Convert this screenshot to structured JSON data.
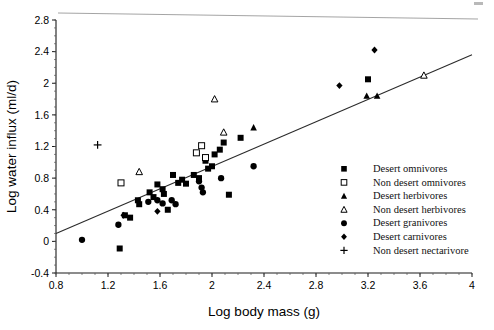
{
  "chart_data": {
    "type": "scatter",
    "title": "",
    "xlabel": "Log body mass (g)",
    "ylabel": "Log water influx (ml/d)",
    "xlim": [
      0.8,
      4.0
    ],
    "ylim": [
      -0.4,
      2.8
    ],
    "xticks": [
      "0.8",
      "1.2",
      "1.6",
      "2",
      "2.4",
      "2.8",
      "3.2",
      "3.6",
      "4"
    ],
    "yticks": [
      "-0.4",
      "0",
      "0.4",
      "0.8",
      "1.2",
      "1.6",
      "2",
      "2.4",
      "2.8"
    ],
    "xtick_values": [
      0.8,
      1.2,
      1.6,
      2.0,
      2.4,
      2.8,
      3.2,
      3.6,
      4.0
    ],
    "ytick_values": [
      -0.4,
      0,
      0.4,
      0.8,
      1.2,
      1.6,
      2.0,
      2.4,
      2.8
    ],
    "grid": false,
    "legend_position": "right-middle",
    "trendline": {
      "label": "regression line",
      "x0": 0.8,
      "y0": 0.1,
      "x1": 4.0,
      "y1": 2.36
    },
    "series": [
      {
        "name": "Desert omnivores",
        "marker": "filled-square",
        "points": [
          [
            1.29,
            -0.09
          ],
          [
            1.33,
            0.33
          ],
          [
            1.37,
            0.3
          ],
          [
            1.43,
            0.52
          ],
          [
            1.44,
            0.47
          ],
          [
            1.52,
            0.62
          ],
          [
            1.55,
            0.56
          ],
          [
            1.58,
            0.72
          ],
          [
            1.62,
            0.66
          ],
          [
            1.63,
            0.6
          ],
          [
            1.66,
            0.4
          ],
          [
            1.7,
            0.84
          ],
          [
            1.74,
            0.74
          ],
          [
            1.77,
            0.78
          ],
          [
            1.8,
            0.73
          ],
          [
            1.86,
            0.84
          ],
          [
            1.9,
            0.8
          ],
          [
            1.95,
            1.02
          ],
          [
            1.97,
            0.92
          ],
          [
            2.0,
            0.95
          ],
          [
            2.02,
            1.1
          ],
          [
            2.06,
            1.16
          ],
          [
            2.09,
            1.25
          ],
          [
            2.13,
            0.59
          ],
          [
            2.22,
            1.31
          ],
          [
            3.2,
            2.05
          ]
        ]
      },
      {
        "name": "Non desert omnivores",
        "marker": "open-square",
        "points": [
          [
            1.3,
            0.74
          ],
          [
            1.88,
            1.12
          ],
          [
            1.92,
            1.21
          ],
          [
            1.95,
            1.06
          ]
        ]
      },
      {
        "name": "Desert herbivores",
        "marker": "filled-triangle",
        "points": [
          [
            2.32,
            1.44
          ],
          [
            3.19,
            1.84
          ],
          [
            3.27,
            1.84
          ]
        ]
      },
      {
        "name": "Non desert herbivores",
        "marker": "open-triangle",
        "points": [
          [
            1.44,
            0.88
          ],
          [
            2.02,
            1.8
          ],
          [
            2.09,
            1.38
          ],
          [
            3.63,
            2.1
          ]
        ]
      },
      {
        "name": "Desert granivores",
        "marker": "filled-circle",
        "points": [
          [
            1.0,
            0.02
          ],
          [
            1.28,
            0.21
          ],
          [
            1.51,
            0.5
          ],
          [
            1.58,
            0.52
          ],
          [
            1.62,
            0.48
          ],
          [
            1.69,
            0.52
          ],
          [
            1.72,
            0.47
          ],
          [
            1.9,
            0.76
          ],
          [
            1.92,
            0.68
          ],
          [
            1.93,
            0.62
          ],
          [
            2.07,
            0.8
          ],
          [
            2.32,
            0.95
          ]
        ]
      },
      {
        "name": "Desert carnivores",
        "marker": "filled-diamond",
        "points": [
          [
            1.32,
            0.33
          ],
          [
            1.58,
            0.38
          ],
          [
            2.98,
            1.97
          ],
          [
            3.25,
            2.42
          ]
        ]
      },
      {
        "name": "Non desert nectarivore",
        "marker": "plus",
        "points": [
          [
            1.12,
            1.22
          ]
        ]
      }
    ]
  },
  "legend": {
    "entries": [
      {
        "label": "Desert omnivores",
        "marker": "filled-square"
      },
      {
        "label": "Non desert omnivores",
        "marker": "open-square"
      },
      {
        "label": "Desert herbivores",
        "marker": "filled-triangle"
      },
      {
        "label": "Non desert herbivores",
        "marker": "open-triangle"
      },
      {
        "label": "Desert granivores",
        "marker": "filled-circle"
      },
      {
        "label": "Desert carnivores",
        "marker": "filled-diamond"
      },
      {
        "label": "Non desert nectarivore",
        "marker": "plus"
      }
    ]
  }
}
